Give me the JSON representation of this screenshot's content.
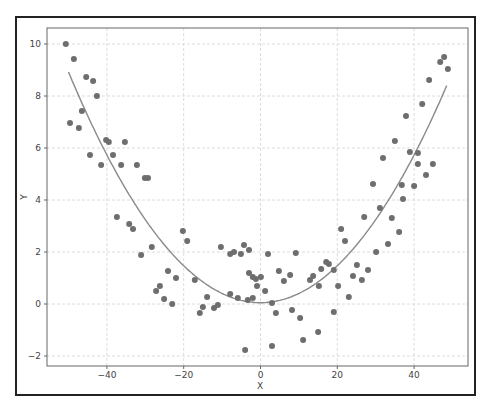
{
  "chart_data": {
    "type": "scatter",
    "title": "",
    "xlabel": "X",
    "ylabel": "Y",
    "xlim": [
      -55,
      54
    ],
    "ylim": [
      -2.4,
      10.6
    ],
    "xticks": [
      -40,
      -20,
      0,
      20,
      40
    ],
    "yticks": [
      -2,
      0,
      2,
      4,
      6,
      8,
      10
    ],
    "xtick_labels": [
      "−40",
      "−20",
      "0",
      "20",
      "40"
    ],
    "ytick_labels": [
      "−2",
      "0",
      "2",
      "4",
      "6",
      "8",
      "10"
    ],
    "grid": true,
    "legend": null,
    "colors": {
      "points": "#6e6e6e",
      "curve": "#8a8a8a",
      "grid": "#dcdcdc",
      "axes": "#555555"
    },
    "series": [
      {
        "name": "data",
        "kind": "scatter",
        "x": [
          -50.7,
          -48.6,
          -45.4,
          -43.6,
          -42.6,
          -46.5,
          -49.6,
          -47.3,
          -40.2,
          -39.5,
          -35.3,
          -44.4,
          -41.5,
          -38.4,
          -36.3,
          -32.2,
          -30.1,
          -29.3,
          -37.4,
          -34.2,
          -33.2,
          -31.1,
          -28.3,
          -20.2,
          -19.1,
          -24.1,
          -26.2,
          -22.0,
          -27.2,
          -25.1,
          -23.0,
          -17.1,
          -15.8,
          -13.9,
          -15.0,
          -12.1,
          -11.1,
          -10.3,
          -6.9,
          -7.9,
          -5.1,
          -4.3,
          -3.0,
          -7.9,
          -5.9,
          -0.9,
          -3.3,
          -2.0,
          -4.0,
          -3.0,
          -2.0,
          -1.2,
          0.1,
          1.95,
          1.2,
          3.0,
          3.0,
          4.8,
          6.1,
          7.7,
          9.2,
          4.0,
          8.2,
          10.3,
          11.1,
          12.9,
          13.7,
          15.0,
          15.2,
          15.8,
          17.1,
          17.8,
          19.1,
          20.2,
          19.1,
          21.0,
          22.0,
          23.0,
          24.1,
          25.1,
          26.4,
          28.0,
          27.0,
          30.1,
          31.1,
          33.2,
          34.2,
          36.1,
          29.3,
          37.1,
          36.8,
          40.0,
          43.1,
          44.9,
          41.0,
          41.0,
          38.9,
          31.9,
          35.0,
          37.9,
          42.1,
          43.9,
          46.8,
          47.8,
          48.8
        ],
        "y": [
          10.0,
          9.42,
          8.73,
          8.58,
          8.0,
          7.42,
          6.96,
          6.77,
          6.31,
          6.23,
          6.23,
          5.73,
          5.35,
          5.73,
          5.35,
          5.35,
          4.85,
          4.85,
          3.35,
          3.08,
          2.88,
          1.88,
          2.19,
          2.81,
          2.42,
          1.27,
          0.69,
          1.0,
          0.5,
          0.19,
          0.0,
          0.92,
          -0.35,
          0.27,
          -0.12,
          -0.15,
          -0.04,
          2.19,
          2.0,
          1.92,
          1.92,
          2.27,
          2.08,
          0.38,
          0.23,
          0.69,
          0.15,
          0.23,
          -1.77,
          1.19,
          1.04,
          0.96,
          1.04,
          1.92,
          0.5,
          0.04,
          -1.62,
          1.27,
          0.88,
          1.12,
          1.96,
          -0.35,
          -0.23,
          -0.54,
          -1.38,
          0.92,
          1.08,
          -1.08,
          0.69,
          1.35,
          1.62,
          1.54,
          1.31,
          0.69,
          -0.31,
          2.88,
          2.42,
          0.27,
          1.08,
          1.5,
          0.92,
          1.31,
          3.35,
          2.0,
          3.69,
          2.31,
          3.31,
          2.77,
          4.62,
          4.04,
          4.58,
          4.54,
          4.96,
          5.38,
          5.38,
          5.81,
          5.85,
          5.62,
          6.27,
          7.23,
          7.69,
          8.62,
          9.31,
          9.5,
          9.04
        ]
      },
      {
        "name": "fit",
        "kind": "line",
        "equation": "y = 0.00355*x^2 + 0.05",
        "x_range": [
          -50,
          48.5
        ]
      }
    ]
  }
}
